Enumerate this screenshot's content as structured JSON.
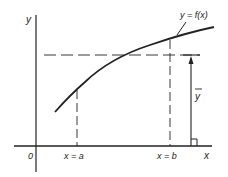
{
  "diagram": {
    "labels": {
      "y_axis": "y",
      "x_axis": "x",
      "origin": "0",
      "curve": "y = f(x)",
      "x_a": "x = a",
      "x_b": "x = b",
      "mean_value": "y"
    },
    "colors": {
      "stroke": "#222222",
      "background": "#ffffff"
    }
  }
}
